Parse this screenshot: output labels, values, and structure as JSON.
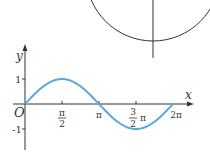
{
  "chart_data": {
    "type": "line",
    "title": "",
    "xlabel": "x",
    "ylabel": "y",
    "origin_label": "O",
    "function": "y = sin x",
    "x": [
      0,
      0.7854,
      1.5708,
      2.3562,
      3.1416,
      3.927,
      4.7124,
      5.4978,
      6.2832
    ],
    "values": [
      0,
      0.707,
      1,
      0.707,
      0,
      -0.707,
      -1,
      -0.707,
      0
    ],
    "xlim": [
      0,
      6.2832
    ],
    "ylim": [
      -1,
      1
    ],
    "x_ticks": [
      {
        "value": 1.5708,
        "label_num": "π",
        "label_den": "2"
      },
      {
        "value": 3.1416,
        "label": "π"
      },
      {
        "value": 4.7124,
        "label_num": "3",
        "label_den": "2",
        "label_suffix": "π"
      },
      {
        "value": 6.2832,
        "label": "2π"
      }
    ],
    "y_ticks": [
      {
        "value": 1,
        "label": "1"
      },
      {
        "value": -1,
        "label": "-1"
      }
    ],
    "grid": false,
    "legend": "none",
    "curve_color": "#5aa8d8",
    "axis_color": "#333333"
  },
  "circle_fragment": {
    "color": "#333333"
  }
}
